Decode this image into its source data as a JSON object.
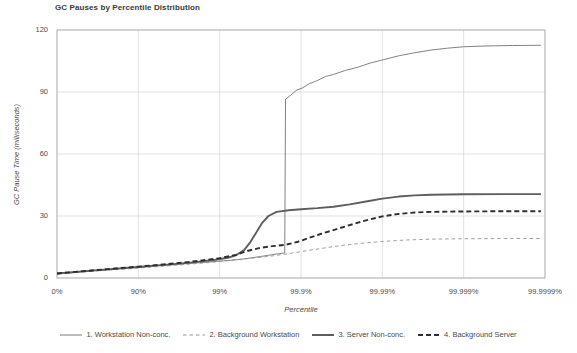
{
  "chart_data": {
    "type": "line",
    "title": "GC Pauses by Percentile Distribution",
    "xlabel": "Percentile",
    "ylabel": "GC Pause Time (milliseconds)",
    "xtick_labels": [
      "0%",
      "90%",
      "99%",
      "99.9%",
      "99.99%",
      "99.999%",
      "99.9999%"
    ],
    "ytick_labels": [
      "0",
      "30",
      "60",
      "90",
      "120"
    ],
    "ylim": [
      0,
      120
    ],
    "grid": true,
    "legend_position": "bottom",
    "legend": [
      "1. Workstation Non-conc.",
      "2. Background Workstation",
      "3. Server Non-conc.",
      "4. Background Server"
    ],
    "series": [
      {
        "name": "1. Workstation Non-conc.",
        "style": "solid",
        "width": "thin",
        "color": "#6b6b6b",
        "points": [
          [
            0.0,
            2.0
          ],
          [
            0.35,
            3.2
          ],
          [
            0.7,
            4.3
          ],
          [
            1.05,
            5.4
          ],
          [
            1.4,
            6.4
          ],
          [
            1.75,
            7.4
          ],
          [
            2.05,
            8.3
          ],
          [
            2.25,
            9.0
          ],
          [
            2.4,
            9.8
          ],
          [
            2.5,
            10.4
          ],
          [
            2.6,
            11.0
          ],
          [
            2.7,
            11.6
          ],
          [
            2.78,
            12.0
          ],
          [
            2.8,
            12.1
          ],
          [
            2.81,
            86.5
          ],
          [
            2.86,
            88.0
          ],
          [
            2.95,
            91.0
          ],
          [
            3.02,
            92.0
          ],
          [
            3.1,
            94.0
          ],
          [
            3.2,
            95.5
          ],
          [
            3.3,
            97.5
          ],
          [
            3.4,
            98.5
          ],
          [
            3.55,
            100.5
          ],
          [
            3.7,
            102.0
          ],
          [
            3.85,
            104.0
          ],
          [
            4.0,
            105.5
          ],
          [
            4.2,
            107.5
          ],
          [
            4.4,
            109.0
          ],
          [
            4.6,
            110.3
          ],
          [
            4.8,
            111.2
          ],
          [
            5.0,
            111.9
          ],
          [
            5.3,
            112.3
          ],
          [
            5.6,
            112.5
          ],
          [
            5.95,
            112.6
          ]
        ]
      },
      {
        "name": "2. Background Workstation",
        "style": "dashed",
        "width": "thin",
        "color": "#8d8d8d",
        "points": [
          [
            0.0,
            2.0
          ],
          [
            0.5,
            3.4
          ],
          [
            1.0,
            4.8
          ],
          [
            1.5,
            6.3
          ],
          [
            1.9,
            7.6
          ],
          [
            2.2,
            8.8
          ],
          [
            2.45,
            9.8
          ],
          [
            2.65,
            10.7
          ],
          [
            2.8,
            11.5
          ],
          [
            2.95,
            12.4
          ],
          [
            3.1,
            13.4
          ],
          [
            3.25,
            14.3
          ],
          [
            3.4,
            15.2
          ],
          [
            3.6,
            16.2
          ],
          [
            3.8,
            17.0
          ],
          [
            4.0,
            17.7
          ],
          [
            4.3,
            18.4
          ],
          [
            4.6,
            18.8
          ],
          [
            5.0,
            19.0
          ],
          [
            5.5,
            19.1
          ],
          [
            5.95,
            19.1
          ]
        ]
      },
      {
        "name": "3. Server Non-conc.",
        "style": "solid",
        "width": "thick",
        "color": "#5e5e5e",
        "points": [
          [
            0.0,
            2.2
          ],
          [
            0.5,
            3.8
          ],
          [
            1.0,
            5.3
          ],
          [
            1.4,
            6.6
          ],
          [
            1.7,
            7.7
          ],
          [
            1.95,
            8.8
          ],
          [
            2.1,
            9.8
          ],
          [
            2.2,
            11.0
          ],
          [
            2.3,
            13.5
          ],
          [
            2.38,
            17.5
          ],
          [
            2.45,
            22.0
          ],
          [
            2.52,
            26.5
          ],
          [
            2.6,
            30.0
          ],
          [
            2.7,
            32.0
          ],
          [
            2.85,
            32.8
          ],
          [
            3.0,
            33.3
          ],
          [
            3.2,
            33.8
          ],
          [
            3.4,
            34.5
          ],
          [
            3.6,
            35.6
          ],
          [
            3.8,
            37.0
          ],
          [
            4.0,
            38.4
          ],
          [
            4.2,
            39.4
          ],
          [
            4.4,
            40.0
          ],
          [
            4.6,
            40.3
          ],
          [
            5.0,
            40.5
          ],
          [
            5.5,
            40.6
          ],
          [
            5.95,
            40.6
          ]
        ]
      },
      {
        "name": "4. Background Server",
        "style": "dashed",
        "width": "thick",
        "color": "#2e2e2e",
        "points": [
          [
            0.0,
            2.2
          ],
          [
            0.5,
            3.9
          ],
          [
            1.0,
            5.5
          ],
          [
            1.4,
            6.9
          ],
          [
            1.75,
            8.3
          ],
          [
            2.0,
            9.6
          ],
          [
            2.2,
            11.2
          ],
          [
            2.35,
            13.2
          ],
          [
            2.5,
            14.6
          ],
          [
            2.65,
            15.4
          ],
          [
            2.8,
            16.0
          ],
          [
            2.95,
            17.4
          ],
          [
            3.1,
            19.4
          ],
          [
            3.25,
            21.4
          ],
          [
            3.4,
            23.2
          ],
          [
            3.55,
            25.0
          ],
          [
            3.7,
            26.8
          ],
          [
            3.85,
            28.4
          ],
          [
            4.0,
            29.8
          ],
          [
            4.2,
            31.0
          ],
          [
            4.4,
            31.7
          ],
          [
            4.6,
            32.0
          ],
          [
            5.0,
            32.2
          ],
          [
            5.5,
            32.3
          ],
          [
            5.95,
            32.3
          ]
        ]
      }
    ]
  }
}
